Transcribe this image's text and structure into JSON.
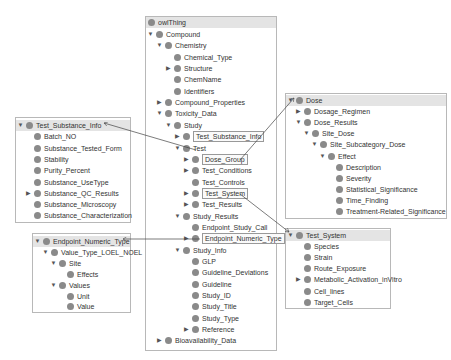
{
  "main_tree": {
    "title": "owlThing",
    "nodes": [
      {
        "label": "Compound",
        "depth": 0,
        "toggle": "expanded"
      },
      {
        "label": "Chemistry",
        "depth": 1,
        "toggle": "expanded"
      },
      {
        "label": "Chemical_Type",
        "depth": 2,
        "toggle": "none"
      },
      {
        "label": "Structure",
        "depth": 2,
        "toggle": "collapsed"
      },
      {
        "label": "ChemName",
        "depth": 2,
        "toggle": "none"
      },
      {
        "label": "Identifiers",
        "depth": 2,
        "toggle": "none"
      },
      {
        "label": "Compound_Properties",
        "depth": 1,
        "toggle": "collapsed"
      },
      {
        "label": "Toxicity_Data",
        "depth": 1,
        "toggle": "expanded"
      },
      {
        "label": "Study",
        "depth": 2,
        "toggle": "expanded"
      },
      {
        "label": "Test_Substance_Info",
        "depth": 3,
        "toggle": "collapsed",
        "boxed": true
      },
      {
        "label": "Test",
        "depth": 3,
        "toggle": "expanded"
      },
      {
        "label": "Dose_Group",
        "depth": 4,
        "toggle": "collapsed",
        "boxed": true
      },
      {
        "label": "Test_Conditions",
        "depth": 4,
        "toggle": "collapsed"
      },
      {
        "label": "Test_Controls",
        "depth": 4,
        "toggle": "none"
      },
      {
        "label": "Test_System",
        "depth": 4,
        "toggle": "collapsed",
        "boxed": true
      },
      {
        "label": "Test_Results",
        "depth": 4,
        "toggle": "collapsed"
      },
      {
        "label": "Study_Results",
        "depth": 3,
        "toggle": "expanded"
      },
      {
        "label": "Endpoint_Study_Call",
        "depth": 4,
        "toggle": "none"
      },
      {
        "label": "Endpoint_Numeric_Type",
        "depth": 4,
        "toggle": "collapsed",
        "boxed": true
      },
      {
        "label": "Study_Info",
        "depth": 3,
        "toggle": "expanded"
      },
      {
        "label": "GLP",
        "depth": 4,
        "toggle": "none"
      },
      {
        "label": "Guideline_Deviations",
        "depth": 4,
        "toggle": "none"
      },
      {
        "label": "Guideline",
        "depth": 4,
        "toggle": "none"
      },
      {
        "label": "Study_ID",
        "depth": 4,
        "toggle": "none"
      },
      {
        "label": "Study_Title",
        "depth": 4,
        "toggle": "none"
      },
      {
        "label": "Study_Type",
        "depth": 4,
        "toggle": "none"
      },
      {
        "label": "Reference",
        "depth": 4,
        "toggle": "collapsed"
      },
      {
        "label": "Bioavailability_Data",
        "depth": 1,
        "toggle": "collapsed"
      }
    ]
  },
  "test_substance_box": {
    "nodes": [
      {
        "label": "Test_Substance_Info",
        "depth": 0,
        "toggle": "expanded",
        "header": true
      },
      {
        "label": "Batch_NO",
        "depth": 1,
        "toggle": "none"
      },
      {
        "label": "Substance_Tested_Form",
        "depth": 1,
        "toggle": "none"
      },
      {
        "label": "Stability",
        "depth": 1,
        "toggle": "none"
      },
      {
        "label": "Purity_Percent",
        "depth": 1,
        "toggle": "none"
      },
      {
        "label": "Substance_UseType",
        "depth": 1,
        "toggle": "none"
      },
      {
        "label": "Substance_QC_Results",
        "depth": 1,
        "toggle": "collapsed"
      },
      {
        "label": "Substance_Microscopy",
        "depth": 1,
        "toggle": "none"
      },
      {
        "label": "Substance_Characterization",
        "depth": 1,
        "toggle": "none"
      }
    ]
  },
  "endpoint_box": {
    "nodes": [
      {
        "label": "Endpoint_Numeric_Type",
        "depth": 0,
        "toggle": "expanded",
        "header": true
      },
      {
        "label": "Value_Type_LOEL_NOEL",
        "depth": 1,
        "toggle": "expanded"
      },
      {
        "label": "Site",
        "depth": 2,
        "toggle": "expanded"
      },
      {
        "label": "Effects",
        "depth": 3,
        "toggle": "none"
      },
      {
        "label": "Values",
        "depth": 2,
        "toggle": "expanded"
      },
      {
        "label": "Unit",
        "depth": 3,
        "toggle": "none"
      },
      {
        "label": "Value",
        "depth": 3,
        "toggle": "none"
      }
    ]
  },
  "dose_box": {
    "nodes": [
      {
        "label": "Dose",
        "depth": 0,
        "toggle": "expanded",
        "header": true
      },
      {
        "label": "Dosage_Regimen",
        "depth": 1,
        "toggle": "collapsed"
      },
      {
        "label": "Dose_Results",
        "depth": 1,
        "toggle": "expanded"
      },
      {
        "label": "Site_Dose",
        "depth": 2,
        "toggle": "expanded"
      },
      {
        "label": "Site_Subcategory_Dose",
        "depth": 3,
        "toggle": "expanded"
      },
      {
        "label": "Effect",
        "depth": 4,
        "toggle": "expanded"
      },
      {
        "label": "Description",
        "depth": 5,
        "toggle": "none"
      },
      {
        "label": "Severity",
        "depth": 5,
        "toggle": "none"
      },
      {
        "label": "Statistical_Significance",
        "depth": 5,
        "toggle": "none"
      },
      {
        "label": "Time_Finding",
        "depth": 5,
        "toggle": "none"
      },
      {
        "label": "Treatment-Related_Significance",
        "depth": 5,
        "toggle": "none"
      }
    ]
  },
  "test_system_box": {
    "nodes": [
      {
        "label": "Test_System",
        "depth": 0,
        "toggle": "expanded",
        "header": true
      },
      {
        "label": "Species",
        "depth": 1,
        "toggle": "none"
      },
      {
        "label": "Strain",
        "depth": 1,
        "toggle": "none"
      },
      {
        "label": "Route_Exposure",
        "depth": 1,
        "toggle": "none"
      },
      {
        "label": "Metabolic_Activation_inVitro",
        "depth": 1,
        "toggle": "collapsed"
      },
      {
        "label": "Cell_lines",
        "depth": 1,
        "toggle": "none"
      },
      {
        "label": "Target_Cells",
        "depth": 1,
        "toggle": "none"
      }
    ]
  },
  "icons": {
    "expanded": "▼",
    "collapsed": "▶",
    "class_node": "grey-circle"
  },
  "colors": {
    "node_dot": "#8a8a8a",
    "header_bg": "#e4e4e4",
    "border": "#b8b8b8",
    "connector": "#444444"
  }
}
